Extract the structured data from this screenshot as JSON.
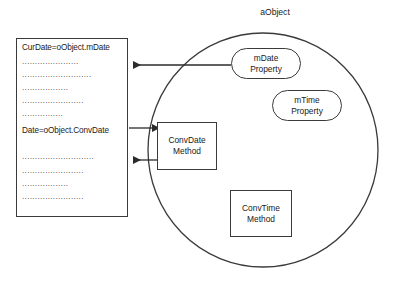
{
  "diagram": {
    "title": "aObject",
    "code_box": {
      "lines": [
        {
          "text": "CurDate=oObject.mDate",
          "kind": "code",
          "top": 4
        },
        {
          "text": "......................",
          "kind": "dots",
          "top": 18
        },
        {
          "text": "...........................",
          "kind": "dots",
          "top": 31
        },
        {
          "text": "..................",
          "kind": "dots",
          "top": 44
        },
        {
          "text": "........................",
          "kind": "dots",
          "top": 57
        },
        {
          "text": "................",
          "kind": "dots",
          "top": 70
        },
        {
          "text": "Date=oObject.ConvDate",
          "kind": "code",
          "top": 87
        },
        {
          "text": "............................",
          "kind": "dots",
          "top": 113
        },
        {
          "text": "........................",
          "kind": "dots",
          "top": 127
        },
        {
          "text": "..................",
          "kind": "dots",
          "top": 140
        },
        {
          "text": "........................",
          "kind": "dots",
          "top": 153
        }
      ]
    },
    "properties": [
      {
        "name": "mDate",
        "stereotype": "Property"
      },
      {
        "name": "mTime",
        "stereotype": "Property"
      }
    ],
    "methods": [
      {
        "name": "ConvDate",
        "stereotype": "Method"
      },
      {
        "name": "ConvTime",
        "stereotype": "Method"
      }
    ],
    "colors": {
      "stroke": "#3a3a3a",
      "text": "#1a1a1a",
      "background": "#ffffff"
    }
  }
}
